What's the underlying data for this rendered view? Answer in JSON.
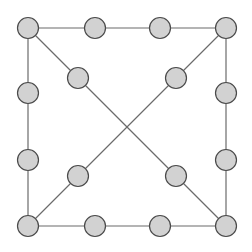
{
  "figure": {
    "kind": "graph-diagram",
    "width": 252,
    "height": 252,
    "background": "#ffffff"
  },
  "style": {
    "node_fill": "#d2d2d2",
    "node_stroke": "#4a4a4a",
    "node_stroke_width": 1.2,
    "node_radius": 10.5,
    "edge_stroke": "#6b6b6b",
    "edge_stroke_width": 1.2
  },
  "chart_data": {
    "type": "scatter",
    "title": "",
    "xlabel": "",
    "ylabel": "",
    "xlim": [
      0,
      252
    ],
    "ylim": [
      0,
      252
    ],
    "grid": false,
    "legend": "none",
    "nodes": [
      {
        "id": "tl",
        "label": "top-left-corner",
        "x": 28,
        "y": 28
      },
      {
        "id": "t1",
        "label": "top-edge-node-1",
        "x": 95,
        "y": 28
      },
      {
        "id": "t2",
        "label": "top-edge-node-2",
        "x": 160,
        "y": 28
      },
      {
        "id": "tr",
        "label": "top-right-corner",
        "x": 226,
        "y": 28
      },
      {
        "id": "r1",
        "label": "right-edge-node-1",
        "x": 226,
        "y": 93
      },
      {
        "id": "r2",
        "label": "right-edge-node-2",
        "x": 226,
        "y": 160
      },
      {
        "id": "br",
        "label": "bottom-right-corner",
        "x": 226,
        "y": 226
      },
      {
        "id": "b2",
        "label": "bottom-edge-node-2",
        "x": 160,
        "y": 226
      },
      {
        "id": "b1",
        "label": "bottom-edge-node-1",
        "x": 95,
        "y": 226
      },
      {
        "id": "bl",
        "label": "bottom-left-corner",
        "x": 28,
        "y": 226
      },
      {
        "id": "l2",
        "label": "left-edge-node-2",
        "x": 28,
        "y": 160
      },
      {
        "id": "l1",
        "label": "left-edge-node-1",
        "x": 28,
        "y": 93
      },
      {
        "id": "d1",
        "label": "inner-upper-left-node",
        "x": 78,
        "y": 78
      },
      {
        "id": "d2",
        "label": "inner-upper-right-node",
        "x": 176,
        "y": 78
      },
      {
        "id": "d3",
        "label": "inner-lower-left-node",
        "x": 78,
        "y": 176
      },
      {
        "id": "d4",
        "label": "inner-lower-right-node",
        "x": 176,
        "y": 176
      }
    ],
    "edges": [
      {
        "id": "e-top",
        "label": "top-side",
        "x1": 28,
        "y1": 28,
        "x2": 226,
        "y2": 28
      },
      {
        "id": "e-right",
        "label": "right-side",
        "x1": 226,
        "y1": 28,
        "x2": 226,
        "y2": 226
      },
      {
        "id": "e-bottom",
        "label": "bottom-side",
        "x1": 28,
        "y1": 226,
        "x2": 226,
        "y2": 226
      },
      {
        "id": "e-left",
        "label": "left-side",
        "x1": 28,
        "y1": 28,
        "x2": 28,
        "y2": 226
      },
      {
        "id": "e-diag-main",
        "label": "diagonal-tl-to-br",
        "x1": 28,
        "y1": 28,
        "x2": 226,
        "y2": 226
      },
      {
        "id": "e-diag-anti",
        "label": "diagonal-tr-to-bl",
        "x1": 226,
        "y1": 28,
        "x2": 28,
        "y2": 226
      }
    ],
    "crossing_point": {
      "x": 126,
      "y": 126
    },
    "counts": {
      "nodes_total": 16,
      "corner_nodes": 4,
      "side_nodes": 8,
      "interior_nodes": 4,
      "edges_total": 6
    }
  }
}
